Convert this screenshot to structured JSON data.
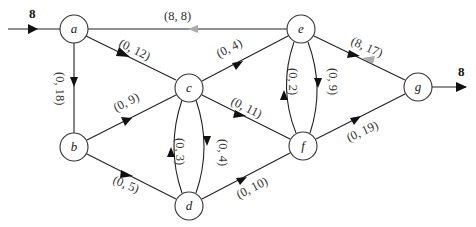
{
  "diagram": {
    "type": "flow-network",
    "source_flow": "8",
    "sink_flow": "8",
    "colors": {
      "edge": "#222222",
      "arrow": "#111111",
      "residual_arrow": "#aaaaaa",
      "node_stroke": "#333333"
    },
    "nodes": [
      {
        "id": "a",
        "label": "a",
        "x": 74,
        "y": 29
      },
      {
        "id": "b",
        "label": "b",
        "x": 74,
        "y": 147
      },
      {
        "id": "c",
        "label": "c",
        "x": 189,
        "y": 88
      },
      {
        "id": "d",
        "label": "d",
        "x": 189,
        "y": 206
      },
      {
        "id": "e",
        "label": "e",
        "x": 301,
        "y": 29
      },
      {
        "id": "f",
        "label": "f",
        "x": 303,
        "y": 146
      },
      {
        "id": "g",
        "label": "g",
        "x": 418,
        "y": 87
      }
    ],
    "edges": [
      {
        "from": "a",
        "to": "e",
        "label": "(8, 8)"
      },
      {
        "from": "a",
        "to": "c",
        "label": "(0, 12)"
      },
      {
        "from": "a",
        "to": "b",
        "label": "(0, 18)"
      },
      {
        "from": "b",
        "to": "c",
        "label": "(0, 9)"
      },
      {
        "from": "b",
        "to": "d",
        "label": "(0, 5)"
      },
      {
        "from": "c",
        "to": "e",
        "label": "(0, 4)"
      },
      {
        "from": "c",
        "to": "f",
        "label": "(0, 11)"
      },
      {
        "from": "c",
        "to": "d",
        "label": "(0, 4)"
      },
      {
        "from": "d",
        "to": "c",
        "label": "(0, 3)"
      },
      {
        "from": "d",
        "to": "f",
        "label": "(0, 10)"
      },
      {
        "from": "e",
        "to": "g",
        "label": "(8, 17)"
      },
      {
        "from": "e",
        "to": "f",
        "label": "(0, 9)"
      },
      {
        "from": "f",
        "to": "e",
        "label": "(0, 2)"
      },
      {
        "from": "f",
        "to": "g",
        "label": "(0, 19)"
      }
    ]
  }
}
